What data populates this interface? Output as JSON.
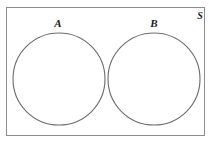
{
  "figure": {
    "type": "venn-diagram",
    "width": 212,
    "height": 143,
    "background_color": "#ffffff"
  },
  "universe": {
    "label": "S",
    "shape": "rectangle",
    "x": 6,
    "y": 7,
    "width": 199,
    "height": 129,
    "stroke_color": "#8d8d8d",
    "fill_color": "#ffffff",
    "stroke_width": 1,
    "label_x": 200,
    "label_y": 19
  },
  "sets": [
    {
      "label": "A",
      "shape": "circle",
      "cx": 59,
      "cy": 79,
      "r": 46,
      "stroke_color": "#6b6b6b",
      "fill_color": "none",
      "stroke_width": 1.1,
      "label_x": 58,
      "label_y": 27
    },
    {
      "label": "B",
      "shape": "circle",
      "cx": 154,
      "cy": 79,
      "r": 46,
      "stroke_color": "#6b6b6b",
      "fill_color": "none",
      "stroke_width": 1.1,
      "label_x": 154,
      "label_y": 27
    }
  ]
}
